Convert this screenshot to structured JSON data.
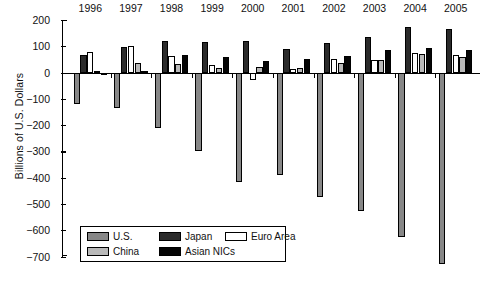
{
  "chart_data": {
    "type": "bar",
    "title": "",
    "xlabel": "",
    "ylabel": "Billions of U.S. Dollars",
    "ylim": [
      -700,
      200
    ],
    "ytick_step": 100,
    "grid": false,
    "legend_position": "bottom-left-inside",
    "categories": [
      "1996",
      "1997",
      "1998",
      "1999",
      "2000",
      "2001",
      "2002",
      "2003",
      "2004",
      "2005"
    ],
    "yticks": [
      "200",
      "100",
      "0",
      "-100",
      "-200",
      "-300",
      "-400",
      "-500",
      "-600",
      "-700"
    ],
    "series": [
      {
        "name": "U.S.",
        "color": "#878787",
        "values": [
          -120,
          -136,
          -210,
          -297,
          -416,
          -389,
          -472,
          -528,
          -625,
          -729
        ]
      },
      {
        "name": "Japan",
        "color": "#2b2b2b",
        "values": [
          66,
          97,
          119,
          115,
          120,
          88,
          112,
          136,
          172,
          166
        ]
      },
      {
        "name": "Euro Area",
        "color": "#ffffff",
        "values": [
          78,
          100,
          62,
          30,
          -28,
          13,
          53,
          46,
          76,
          67
        ]
      },
      {
        "name": "China",
        "color": "#b9b9b9",
        "values": [
          7,
          37,
          31,
          16,
          21,
          17,
          35,
          46,
          69,
          61
        ]
      },
      {
        "name": "Asian NICs",
        "color": "#050505",
        "values": [
          -2,
          5,
          67,
          59,
          44,
          52,
          64,
          84,
          93,
          87
        ]
      }
    ]
  },
  "legend": {
    "entries": [
      {
        "label": "U.S.",
        "swatch": "legend-swatch-us"
      },
      {
        "label": "Japan",
        "swatch": "legend-swatch-japan"
      },
      {
        "label": "Euro Area",
        "swatch": "legend-swatch-euro"
      },
      {
        "label": "China",
        "swatch": "legend-swatch-china"
      },
      {
        "label": "Asian NICs",
        "swatch": "legend-swatch-nics"
      }
    ]
  }
}
